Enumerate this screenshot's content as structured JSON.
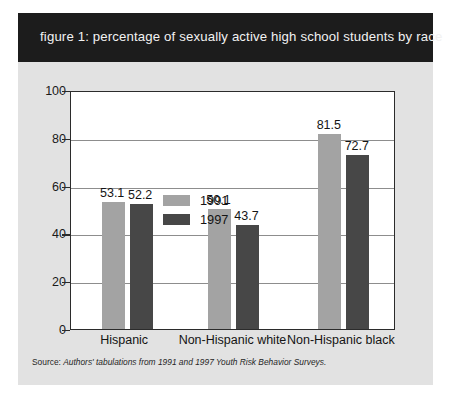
{
  "figure": {
    "title": "figure 1: percentage of sexually active high school students by race",
    "source_prefix": "Source: ",
    "source_italic": "Authors' tabulations from 1991 and 1997 Youth Risk Behavior Surveys."
  },
  "colors": {
    "panel_background": "#e2e2e2",
    "title_bar": "#1c1c1c",
    "title_text": "#f2f2f2",
    "series_1991": "#a3a3a3",
    "series_1997": "#474747",
    "plot_background": "#ffffff",
    "axis": "#2b2b2b",
    "gridline": "#8d8d8d"
  },
  "chart_data": {
    "type": "bar",
    "title": "figure 1: percentage of sexually active high school students by race",
    "xlabel": "",
    "ylabel": "",
    "categories": [
      "Hispanic",
      "Non-Hispanic white",
      "Non-Hispanic black"
    ],
    "series": [
      {
        "name": "1991",
        "color": "#a3a3a3",
        "values": [
          53.1,
          52.2,
          50.1
        ]
      },
      {
        "name": "1997",
        "color": "#474747",
        "values": [
          52.2,
          43.7,
          72.7
        ]
      }
    ],
    "groups": [
      {
        "category": "Hispanic",
        "bars": [
          {
            "series": "1991",
            "value": 53.1,
            "label": "53.1"
          },
          {
            "series": "1997",
            "value": 52.2,
            "label": "52.2"
          }
        ]
      },
      {
        "category": "Non-Hispanic white",
        "bars": [
          {
            "series": "1991",
            "value": 50.1,
            "label": "50.1"
          },
          {
            "series": "1997",
            "value": 43.7,
            "label": "43.7"
          }
        ]
      },
      {
        "category": "Non-Hispanic black",
        "bars": [
          {
            "series": "1991",
            "value": 81.5,
            "label": "81.5"
          },
          {
            "series": "1997",
            "value": 72.7,
            "label": "72.7"
          }
        ]
      }
    ],
    "ylim": [
      0,
      100
    ],
    "yticks": [
      0,
      20,
      40,
      60,
      80,
      100
    ],
    "ytick_labels": [
      "0",
      "20",
      "40",
      "60",
      "80",
      "100"
    ],
    "grid": true,
    "grid_axis": "y",
    "legend": {
      "position": "top-left",
      "entries": [
        "1991",
        "1997"
      ]
    },
    "data_labels": true,
    "source": "Source: Authors' tabulations from 1991 and 1997 Youth Risk Behavior Surveys."
  }
}
